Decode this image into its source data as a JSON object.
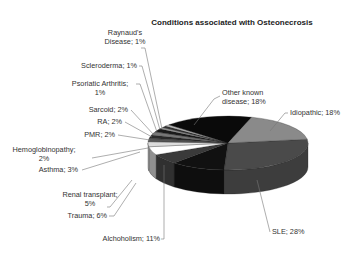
{
  "chart_data": {
    "type": "pie",
    "variant": "3d-pie",
    "title": "Conditions associated with Osteonecrosis",
    "slices": [
      {
        "name": "SLE",
        "value": 28,
        "label": "SLE; 28%",
        "color": "#4a4a4a"
      },
      {
        "name": "Alchoholism",
        "value": 11,
        "label": "Alchoholism; 11%",
        "color": "#111111"
      },
      {
        "name": "Trauma",
        "value": 6,
        "label": "Trauma; 6%",
        "color": "#3a3a3a"
      },
      {
        "name": "Renal transplant",
        "value": 5,
        "label": [
          "Renal transplant;",
          "5%"
        ],
        "color": "#ffffff"
      },
      {
        "name": "Asthma",
        "value": 3,
        "label": "Asthma; 3%",
        "color": "#dddddd"
      },
      {
        "name": "Hemoglobinopathy",
        "value": 2,
        "label": [
          "Hemoglobinopathy;",
          "2%"
        ],
        "color": "#555555"
      },
      {
        "name": "PMR",
        "value": 2,
        "label": "PMR; 2%",
        "color": "#2a2a2a"
      },
      {
        "name": "RA",
        "value": 2,
        "label": "RA; 2%",
        "color": "#777777"
      },
      {
        "name": "Sarcoid",
        "value": 2,
        "label": "Sarcoid; 2%",
        "color": "#1a1a1a"
      },
      {
        "name": "Psoriatic Arthritis",
        "value": 1,
        "label": [
          "Psoriatic Arthritis;",
          "1%"
        ],
        "color": "#999999"
      },
      {
        "name": "Scleroderma",
        "value": 1,
        "label": "Scleroderma; 1%",
        "color": "#333333"
      },
      {
        "name": "Raynaud's Disease",
        "value": 1,
        "label": [
          "Raynaud's",
          "Disease; 1%"
        ],
        "color": "#bbbbbb"
      },
      {
        "name": "Other known disease",
        "value": 18,
        "label": [
          "Other known",
          "disease; 18%"
        ],
        "color": "#0a0a0a"
      },
      {
        "name": "Idiopathic",
        "value": 18,
        "label": "Idiopathic; 18%",
        "color": "#8a8a8a"
      }
    ],
    "legend": "none",
    "data_labels": "outside-with-leaders"
  }
}
